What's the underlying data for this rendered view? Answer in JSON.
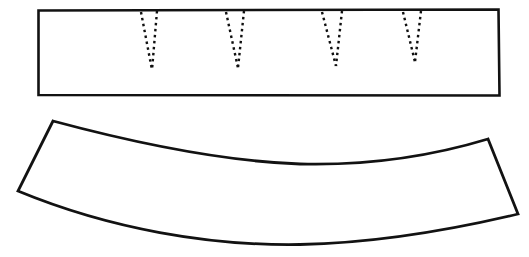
{
  "figure": {
    "background_color": "#ffffff",
    "line_color": "#121212",
    "canvas": {
      "width": 529,
      "height": 257
    }
  },
  "pieces": [
    {
      "id": "straight-band",
      "label": "Straight rectangular band piece",
      "shape": "rectangle",
      "stroke_width": 2.6,
      "outline_path": "M 38.5 10.5 L 498.5 9.5 L 499.5 95.5 L 38.5 95.0 Z",
      "corners": [
        {
          "x": 38.5,
          "y": 10.5
        },
        {
          "x": 498.5,
          "y": 9.5
        },
        {
          "x": 499.5,
          "y": 95.5
        },
        {
          "x": 38.5,
          "y": 95.0
        }
      ]
    },
    {
      "id": "curved-band",
      "label": "Curved band piece",
      "shape": "curved-band",
      "stroke_width": 2.8,
      "outline_path": "M 53 121 C 120 139, 215 161, 300 164 C 380 166, 445 152, 488 139 L 518 214 C 455 229, 375 243, 300 244.5 C 210 246, 110 229, 18 191 Z",
      "corners": [
        {
          "x": 53,
          "y": 121
        },
        {
          "x": 488,
          "y": 139
        },
        {
          "x": 518,
          "y": 214
        },
        {
          "x": 18,
          "y": 191
        }
      ]
    }
  ],
  "darts": {
    "style": "dotted",
    "count": 4,
    "stroke_width": 2.4,
    "dash_pattern": "2.5 3.5",
    "items": [
      {
        "id": "dart-1",
        "left_path": "M 141 12 L 152 70",
        "right_path": "M 157 11 L 152 70",
        "top_left_x": 141,
        "top_right_x": 157,
        "apex_x": 152,
        "apex_y": 70,
        "top_y": 11
      },
      {
        "id": "dart-2",
        "left_path": "M 226 12 L 238 68",
        "right_path": "M 244 11 L 238 68",
        "top_left_x": 226,
        "top_right_x": 244,
        "apex_x": 238,
        "apex_y": 68,
        "top_y": 11
      },
      {
        "id": "dart-3",
        "left_path": "M 322 12 L 336 66",
        "right_path": "M 342 11 L 336 66",
        "top_left_x": 322,
        "top_right_x": 342,
        "apex_x": 336,
        "apex_y": 66,
        "top_y": 11
      },
      {
        "id": "dart-4",
        "left_path": "M 403 12 L 415 62",
        "right_path": "M 421 11 L 415 62",
        "top_left_x": 403,
        "top_right_x": 421,
        "apex_x": 415,
        "apex_y": 62,
        "top_y": 11
      }
    ]
  }
}
